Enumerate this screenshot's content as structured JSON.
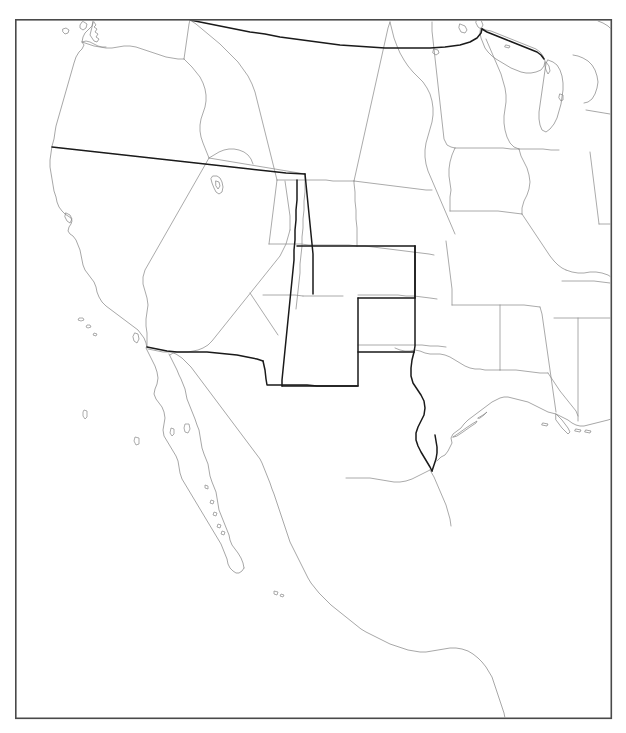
{
  "page": {
    "title_fragment": "",
    "background_color": "#ffffff",
    "width": 626,
    "height": 733
  },
  "frame": {
    "name": "map-frame",
    "x": 15,
    "y": 19,
    "width": 597,
    "height": 700,
    "stroke_color": "#4a4a4a",
    "fill_color": "#ffffff"
  },
  "map": {
    "type": "outline-map",
    "region": "Western North America",
    "projection_note": "conic",
    "line_colors": {
      "coastline": "#8a8a8a",
      "state_boundary": "#8d8d8d",
      "national_boundary": "#1a1a1a"
    },
    "features": [
      {
        "name": "us-canada-border",
        "class": "border-major"
      },
      {
        "name": "us-mexico-border",
        "class": "border-major"
      },
      {
        "name": "california-oregon-border",
        "class": "border-major"
      },
      {
        "name": "utah-border",
        "class": "border-major"
      },
      {
        "name": "colorado-border",
        "class": "border-major"
      },
      {
        "name": "arizona-new-mexico-border",
        "class": "border-major"
      },
      {
        "name": "texas-panhandle-border",
        "class": "border-major"
      },
      {
        "name": "pacific-coastline",
        "class": "coast"
      },
      {
        "name": "gulf-of-mexico-coastline",
        "class": "coast"
      },
      {
        "name": "baja-california-peninsula",
        "class": "coast"
      },
      {
        "name": "gulf-of-california",
        "class": "coast"
      },
      {
        "name": "great-lakes",
        "class": "coast"
      },
      {
        "name": "great-salt-lake",
        "class": "coast"
      },
      {
        "name": "mississippi-delta",
        "class": "coast"
      }
    ]
  }
}
